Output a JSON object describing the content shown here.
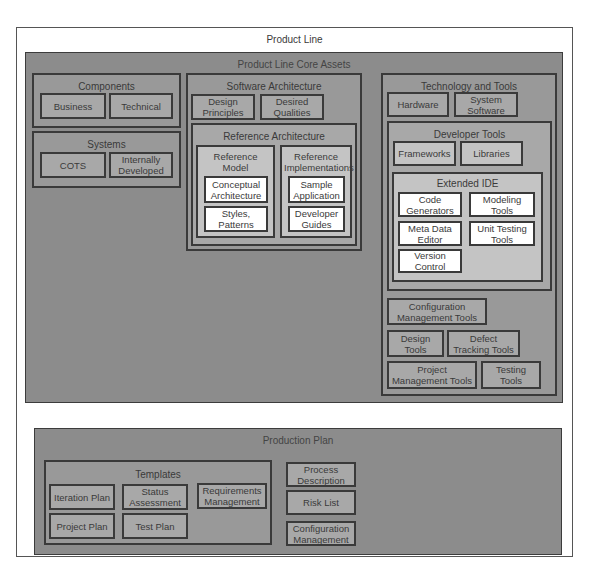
{
  "product_line": {
    "title": "Product Line",
    "core_assets": {
      "title": "Product Line Core Assets",
      "components": {
        "title": "Components",
        "items": [
          "Business",
          "Technical"
        ]
      },
      "systems": {
        "title": "Systems",
        "items": [
          "COTS",
          "Internally Developed"
        ]
      },
      "software_architecture": {
        "title": "Software Architecture",
        "items": [
          "Design Principles",
          "Desired Qualities"
        ],
        "reference_architecture": {
          "title": "Reference Architecture",
          "reference_model": {
            "title": "Reference Model",
            "items": [
              "Conceptual Architecture",
              "Styles, Patterns"
            ]
          },
          "reference_implementations": {
            "title": "Reference Implementations",
            "items": [
              "Sample Application",
              "Developer Guides"
            ]
          }
        }
      },
      "technology_and_tools": {
        "title": "Technology and Tools",
        "items": [
          "Hardware",
          "System Software"
        ],
        "developer_tools": {
          "title": "Developer Tools",
          "items": [
            "Frameworks",
            "Libraries"
          ],
          "extended_ide": {
            "title": "Extended IDE",
            "items": [
              "Code Generators",
              "Modeling Tools",
              "Meta Data Editor",
              "Unit Testing Tools",
              "Version Control"
            ]
          }
        },
        "other_tools": [
          "Configuration Management Tools",
          "Design Tools",
          "Defect Tracking Tools",
          "Project Management Tools",
          "Testing Tools"
        ]
      }
    },
    "production_plan": {
      "title": "Production Plan",
      "templates": {
        "title": "Templates",
        "items": [
          "Iteration Plan",
          "Status Assessment",
          "Requirements Management",
          "Project Plan",
          "Test Plan"
        ]
      },
      "items": [
        "Process Description",
        "Risk List",
        "Configuration Management"
      ]
    }
  }
}
